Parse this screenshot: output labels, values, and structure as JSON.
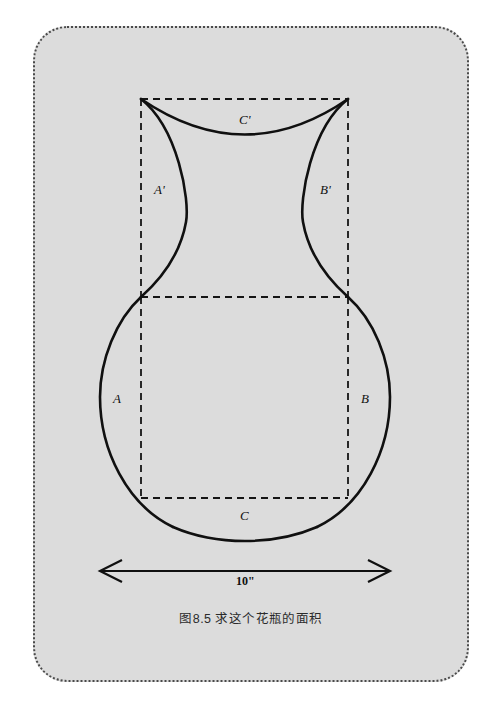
{
  "figure": {
    "caption": "图8.5  求这个花瓶的面积",
    "panel_bg": "#dcdcdc",
    "stroke_color": "#101010",
    "border_style": "dotted-rounded",
    "labels": {
      "arc_left_bulb": "A",
      "arc_right_bulb": "B",
      "arc_bottom_bulb": "C",
      "arc_left_neck": "A'",
      "arc_right_neck": "B'",
      "arc_top_neck": "C'"
    },
    "dimension": {
      "value": "10\"",
      "description": "width-arrow"
    },
    "geometry": {
      "square_left": 141,
      "square_right": 348,
      "square_top": 297,
      "square_bottom": 498,
      "neck_top": 99,
      "bulb_center_x": 245,
      "bulb_center_y": 397,
      "bulb_radius": 145,
      "bulb_bottom": 540
    }
  }
}
